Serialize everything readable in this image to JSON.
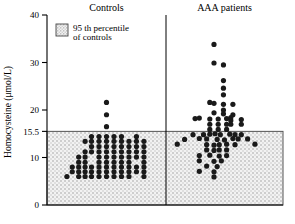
{
  "chart_data": {
    "type": "scatter",
    "title": "",
    "xlabel": "",
    "ylabel": "Homocysteine  (μmol/L)",
    "ylim": [
      0,
      40
    ],
    "yticks": [
      0,
      10,
      15.5,
      20,
      30,
      40
    ],
    "ytick_labels": [
      "0",
      "10",
      "15.5",
      "20",
      "30",
      "40"
    ],
    "grid": false,
    "legend_position": "top-left",
    "annotations": {
      "threshold_value": 15.5,
      "threshold_label": "95 th percentile of controls",
      "shaded_band": [
        0,
        15.5
      ]
    },
    "categories": [
      "Controls",
      "AAA patients"
    ],
    "series": [
      {
        "name": "Controls",
        "jitter_axis": "x",
        "points": [
          {
            "x": 0.5,
            "y": 21.6
          },
          {
            "x": 0.5,
            "y": 19.0
          },
          {
            "x": 0.5,
            "y": 16.5
          },
          {
            "x": 0.36,
            "y": 14.4
          },
          {
            "x": 0.43,
            "y": 14.4
          },
          {
            "x": 0.5,
            "y": 14.4
          },
          {
            "x": 0.57,
            "y": 14.4
          },
          {
            "x": 0.64,
            "y": 14.4
          },
          {
            "x": 0.78,
            "y": 14.4
          },
          {
            "x": 0.3,
            "y": 13.4
          },
          {
            "x": 0.36,
            "y": 13.4
          },
          {
            "x": 0.43,
            "y": 13.4
          },
          {
            "x": 0.5,
            "y": 13.4
          },
          {
            "x": 0.57,
            "y": 13.4
          },
          {
            "x": 0.64,
            "y": 13.4
          },
          {
            "x": 0.71,
            "y": 13.4
          },
          {
            "x": 0.78,
            "y": 13.4
          },
          {
            "x": 0.85,
            "y": 13.4
          },
          {
            "x": 0.36,
            "y": 12.3
          },
          {
            "x": 0.43,
            "y": 12.3
          },
          {
            "x": 0.5,
            "y": 12.3
          },
          {
            "x": 0.57,
            "y": 12.3
          },
          {
            "x": 0.64,
            "y": 12.3
          },
          {
            "x": 0.71,
            "y": 12.3
          },
          {
            "x": 0.78,
            "y": 12.3
          },
          {
            "x": 0.85,
            "y": 12.3
          },
          {
            "x": 0.3,
            "y": 11.2
          },
          {
            "x": 0.36,
            "y": 11.2
          },
          {
            "x": 0.43,
            "y": 11.2
          },
          {
            "x": 0.5,
            "y": 11.2
          },
          {
            "x": 0.57,
            "y": 11.2
          },
          {
            "x": 0.64,
            "y": 11.2
          },
          {
            "x": 0.71,
            "y": 11.2
          },
          {
            "x": 0.78,
            "y": 11.2
          },
          {
            "x": 0.85,
            "y": 11.2
          },
          {
            "x": 0.24,
            "y": 10.1
          },
          {
            "x": 0.3,
            "y": 10.1
          },
          {
            "x": 0.43,
            "y": 10.1
          },
          {
            "x": 0.5,
            "y": 10.1
          },
          {
            "x": 0.57,
            "y": 10.1
          },
          {
            "x": 0.64,
            "y": 10.1
          },
          {
            "x": 0.71,
            "y": 10.1
          },
          {
            "x": 0.78,
            "y": 10.1
          },
          {
            "x": 0.85,
            "y": 10.1
          },
          {
            "x": 0.24,
            "y": 9.0
          },
          {
            "x": 0.3,
            "y": 9.0
          },
          {
            "x": 0.43,
            "y": 9.0
          },
          {
            "x": 0.5,
            "y": 9.0
          },
          {
            "x": 0.57,
            "y": 9.0
          },
          {
            "x": 0.64,
            "y": 9.0
          },
          {
            "x": 0.71,
            "y": 9.0
          },
          {
            "x": 0.85,
            "y": 9.0
          },
          {
            "x": 0.18,
            "y": 8.0
          },
          {
            "x": 0.24,
            "y": 8.0
          },
          {
            "x": 0.3,
            "y": 8.0
          },
          {
            "x": 0.36,
            "y": 8.0
          },
          {
            "x": 0.43,
            "y": 8.0
          },
          {
            "x": 0.5,
            "y": 8.0
          },
          {
            "x": 0.57,
            "y": 8.0
          },
          {
            "x": 0.64,
            "y": 8.0
          },
          {
            "x": 0.71,
            "y": 8.0
          },
          {
            "x": 0.78,
            "y": 8.0
          },
          {
            "x": 0.85,
            "y": 8.0
          },
          {
            "x": 0.18,
            "y": 7.0
          },
          {
            "x": 0.24,
            "y": 7.0
          },
          {
            "x": 0.3,
            "y": 7.0
          },
          {
            "x": 0.36,
            "y": 7.0
          },
          {
            "x": 0.43,
            "y": 7.0
          },
          {
            "x": 0.5,
            "y": 7.0
          },
          {
            "x": 0.57,
            "y": 7.0
          },
          {
            "x": 0.64,
            "y": 7.0
          },
          {
            "x": 0.71,
            "y": 7.0
          },
          {
            "x": 0.78,
            "y": 7.0
          },
          {
            "x": 0.85,
            "y": 7.0
          },
          {
            "x": 0.13,
            "y": 6.0
          },
          {
            "x": 0.24,
            "y": 6.0
          },
          {
            "x": 0.3,
            "y": 6.0
          },
          {
            "x": 0.36,
            "y": 6.0
          },
          {
            "x": 0.43,
            "y": 6.0
          },
          {
            "x": 0.5,
            "y": 6.0
          },
          {
            "x": 0.57,
            "y": 6.0
          },
          {
            "x": 0.64,
            "y": 6.0
          },
          {
            "x": 0.71,
            "y": 6.0
          },
          {
            "x": 0.85,
            "y": 6.0
          }
        ]
      },
      {
        "name": "AAA patients",
        "jitter_axis": "x",
        "points": [
          {
            "x": 0.4,
            "y": 33.8
          },
          {
            "x": 0.4,
            "y": 29.9
          },
          {
            "x": 0.49,
            "y": 29.5
          },
          {
            "x": 0.49,
            "y": 26.2
          },
          {
            "x": 0.49,
            "y": 24.6
          },
          {
            "x": 0.49,
            "y": 23.2
          },
          {
            "x": 0.36,
            "y": 21.6
          },
          {
            "x": 0.4,
            "y": 21.4
          },
          {
            "x": 0.49,
            "y": 21.2
          },
          {
            "x": 0.58,
            "y": 21.2
          },
          {
            "x": 0.49,
            "y": 20.0
          },
          {
            "x": 0.4,
            "y": 19.4
          },
          {
            "x": 0.49,
            "y": 19.2
          },
          {
            "x": 0.58,
            "y": 19.0
          },
          {
            "x": 0.22,
            "y": 18.2
          },
          {
            "x": 0.26,
            "y": 18.3
          },
          {
            "x": 0.36,
            "y": 18.1
          },
          {
            "x": 0.44,
            "y": 18.1
          },
          {
            "x": 0.52,
            "y": 18.2
          },
          {
            "x": 0.56,
            "y": 18.4
          },
          {
            "x": 0.56,
            "y": 17.8
          },
          {
            "x": 0.66,
            "y": 18.0
          },
          {
            "x": 0.36,
            "y": 17.0
          },
          {
            "x": 0.44,
            "y": 17.0
          },
          {
            "x": 0.52,
            "y": 17.0
          },
          {
            "x": 0.56,
            "y": 17.0
          },
          {
            "x": 0.66,
            "y": 17.0
          },
          {
            "x": 0.36,
            "y": 15.9
          },
          {
            "x": 0.44,
            "y": 15.9
          },
          {
            "x": 0.52,
            "y": 15.9
          },
          {
            "x": 0.2,
            "y": 14.8
          },
          {
            "x": 0.3,
            "y": 14.8
          },
          {
            "x": 0.36,
            "y": 14.9
          },
          {
            "x": 0.41,
            "y": 15.0
          },
          {
            "x": 0.46,
            "y": 14.8
          },
          {
            "x": 0.55,
            "y": 14.9
          },
          {
            "x": 0.6,
            "y": 14.8
          },
          {
            "x": 0.66,
            "y": 14.8
          },
          {
            "x": 0.12,
            "y": 13.8
          },
          {
            "x": 0.26,
            "y": 14.0
          },
          {
            "x": 0.33,
            "y": 13.9
          },
          {
            "x": 0.43,
            "y": 13.8
          },
          {
            "x": 0.5,
            "y": 13.7
          },
          {
            "x": 0.58,
            "y": 14.0
          },
          {
            "x": 0.63,
            "y": 13.9
          },
          {
            "x": 0.72,
            "y": 13.9
          },
          {
            "x": 0.05,
            "y": 12.8
          },
          {
            "x": 0.33,
            "y": 12.7
          },
          {
            "x": 0.4,
            "y": 12.6
          },
          {
            "x": 0.45,
            "y": 12.7
          },
          {
            "x": 0.52,
            "y": 12.8
          },
          {
            "x": 0.6,
            "y": 12.7
          },
          {
            "x": 0.79,
            "y": 12.8
          },
          {
            "x": 0.33,
            "y": 11.6
          },
          {
            "x": 0.4,
            "y": 11.5
          },
          {
            "x": 0.45,
            "y": 11.6
          },
          {
            "x": 0.52,
            "y": 11.6
          },
          {
            "x": 0.26,
            "y": 10.4
          },
          {
            "x": 0.36,
            "y": 10.5
          },
          {
            "x": 0.45,
            "y": 10.3
          },
          {
            "x": 0.52,
            "y": 10.4
          },
          {
            "x": 0.26,
            "y": 9.3
          },
          {
            "x": 0.4,
            "y": 9.2
          },
          {
            "x": 0.47,
            "y": 9.3
          },
          {
            "x": 0.33,
            "y": 8.2
          },
          {
            "x": 0.43,
            "y": 8.1
          },
          {
            "x": 0.26,
            "y": 7.1
          },
          {
            "x": 0.4,
            "y": 7.0
          },
          {
            "x": 0.4,
            "y": 5.9
          }
        ]
      }
    ]
  },
  "axis": {
    "ylabel": "Homocysteine  (μmol/L)",
    "ticks": [
      {
        "value": 40,
        "label": "40"
      },
      {
        "value": 30,
        "label": "30"
      },
      {
        "value": 20,
        "label": "20"
      },
      {
        "value": 15.5,
        "label": "15.5"
      },
      {
        "value": 10,
        "label": "10"
      },
      {
        "value": 0,
        "label": "0"
      }
    ]
  },
  "groups": [
    {
      "key": "controls",
      "title": "Controls"
    },
    {
      "key": "aaa",
      "title": "AAA patients"
    }
  ],
  "legend": {
    "line1": "95 th percentile",
    "line2": "of controls"
  },
  "colors": {
    "marker": "#1a1a1a",
    "axis": "#000000",
    "band_fill": "#f0f0f0",
    "band_dot": "#9a9a9a",
    "background": "#ffffff"
  }
}
